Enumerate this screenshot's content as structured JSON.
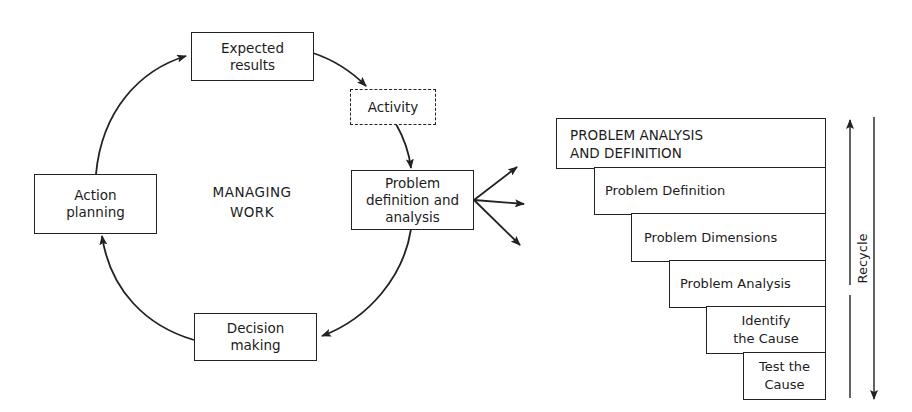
{
  "cycle": {
    "center_label": "MANAGING\nWORK",
    "nodes": [
      {
        "id": "expected-results",
        "label": "Expected\nresults",
        "style": "solid"
      },
      {
        "id": "activity",
        "label": "Activity",
        "style": "dashed"
      },
      {
        "id": "problem-definition",
        "label": "Problem\ndefinition and\nanalysis",
        "style": "solid"
      },
      {
        "id": "decision-making",
        "label": "Decision\nmaking",
        "style": "solid"
      },
      {
        "id": "action-planning",
        "label": "Action\nplanning",
        "style": "solid"
      }
    ],
    "flow": [
      "Action planning",
      "Expected results",
      "Activity",
      "Problem definition and analysis",
      "Decision making",
      "Action planning"
    ],
    "fan_out_arrows": 3
  },
  "staircase": {
    "steps": [
      {
        "label": "PROBLEM ANALYSIS\n   AND DEFINITION"
      },
      {
        "label": "Problem Definition"
      },
      {
        "label": "Problem Dimensions"
      },
      {
        "label": "Problem Analysis"
      },
      {
        "label": "Identify\nthe Cause"
      },
      {
        "label": "Test the\nCause"
      }
    ],
    "recycle_label": "Recycle"
  },
  "colors": {
    "line": "#222222",
    "background": "#ffffff"
  }
}
